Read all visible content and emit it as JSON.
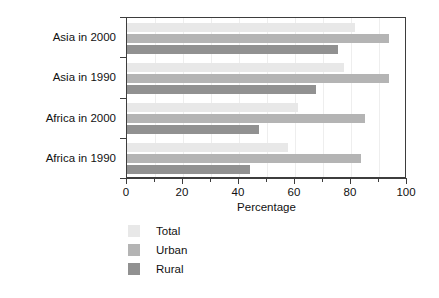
{
  "chart_data": {
    "type": "bar",
    "orientation": "horizontal",
    "title": "",
    "xlabel": "Percentage",
    "ylabel": "",
    "xlim": [
      0,
      100
    ],
    "xticks": [
      0,
      20,
      40,
      60,
      80,
      100
    ],
    "xticklabels": [
      "0",
      "20",
      "40",
      "60",
      "80",
      "100"
    ],
    "xminorticks": [
      10,
      30,
      50,
      70,
      90
    ],
    "grid": "vertical-light",
    "legend_position": "below-left",
    "categories": [
      "Asia in 2000",
      "Asia in 1990",
      "Africa in 2000",
      "Africa in 1990"
    ],
    "series": [
      {
        "name": "Total",
        "color": "#e8e8e8",
        "values": [
          81.5,
          77.5,
          61.0,
          57.5
        ]
      },
      {
        "name": "Urban",
        "color": "#b4b4b4",
        "values": [
          93.5,
          93.5,
          85.0,
          83.5
        ]
      },
      {
        "name": "Rural",
        "color": "#919191",
        "values": [
          75.5,
          67.5,
          47.0,
          44.0
        ]
      }
    ]
  },
  "axis": {
    "x_title": "Percentage"
  },
  "legend": {
    "items": [
      {
        "label": "Total",
        "color": "#e8e8e8"
      },
      {
        "label": "Urban",
        "color": "#b4b4b4"
      },
      {
        "label": "Rural",
        "color": "#919191"
      }
    ]
  },
  "colors": {
    "frame": "#3d3d3d",
    "gridline": "#eeeeee",
    "text": "#111111",
    "background": "#ffffff"
  }
}
